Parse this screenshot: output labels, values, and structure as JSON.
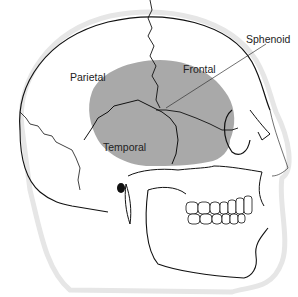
{
  "diagram": {
    "labels": [
      {
        "id": "parietal",
        "text": "Parietal"
      },
      {
        "id": "frontal",
        "text": "Frontal"
      },
      {
        "id": "temporal",
        "text": "Temporal"
      },
      {
        "id": "sphenoid",
        "text": "Sphenoid"
      }
    ],
    "colors": {
      "highlight": "#a9a9a9",
      "outline": "#111111",
      "halo": "#e4e4e4",
      "background": "#ffffff"
    }
  }
}
